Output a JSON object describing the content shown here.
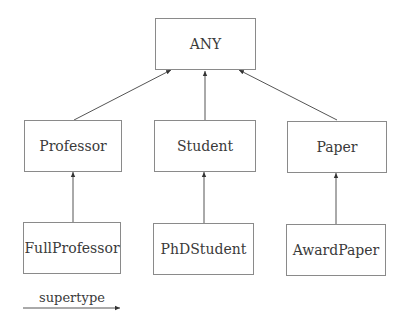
{
  "diagram": {
    "type": "type-hierarchy",
    "nodes": [
      {
        "id": "any",
        "label": "ANY"
      },
      {
        "id": "professor",
        "label": "Professor"
      },
      {
        "id": "student",
        "label": "Student"
      },
      {
        "id": "paper",
        "label": "Paper"
      },
      {
        "id": "fullprofessor",
        "label": "FullProfessor"
      },
      {
        "id": "phdstudent",
        "label": "PhDStudent"
      },
      {
        "id": "awardpaper",
        "label": "AwardPaper"
      }
    ],
    "edges": [
      {
        "from": "professor",
        "to": "any",
        "label": "supertype"
      },
      {
        "from": "student",
        "to": "any",
        "label": "supertype"
      },
      {
        "from": "paper",
        "to": "any",
        "label": "supertype"
      },
      {
        "from": "fullprofessor",
        "to": "professor",
        "label": "supertype"
      },
      {
        "from": "phdstudent",
        "to": "student",
        "label": "supertype"
      },
      {
        "from": "awardpaper",
        "to": "paper",
        "label": "supertype"
      }
    ],
    "legend": {
      "label": "supertype"
    }
  }
}
